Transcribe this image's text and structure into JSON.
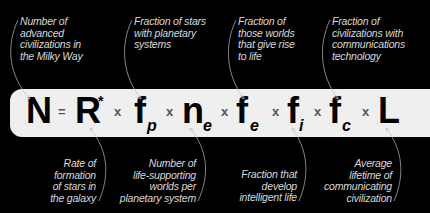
{
  "colors": {
    "background": "#000000",
    "bar": "#efefef",
    "symbol": "#000000",
    "operator": "#555555",
    "label_text": "#d8d8d8",
    "arrow": "#bbbbbb"
  },
  "equation": {
    "lhs": "N",
    "equals": "=",
    "operator": "x",
    "terms": [
      {
        "symbol": "R",
        "superscript": "*",
        "subscript": ""
      },
      {
        "symbol": "f",
        "superscript": "",
        "subscript": "p"
      },
      {
        "symbol": "n",
        "superscript": "",
        "subscript": "e"
      },
      {
        "symbol": "f",
        "superscript": "",
        "subscript": "e"
      },
      {
        "symbol": "f",
        "superscript": "",
        "subscript": "i"
      },
      {
        "symbol": "f",
        "superscript": "",
        "subscript": "c"
      },
      {
        "symbol": "L",
        "superscript": "",
        "subscript": ""
      }
    ]
  },
  "labels": {
    "top": [
      {
        "target": "N",
        "text": "Number of\nadvanced\ncivilizations in\nthe Milky Way"
      },
      {
        "target": "f_p",
        "text": "Fraction of stars\nwith planetary\nsystems"
      },
      {
        "target": "f_e",
        "text": "Fraction of\nthose worlds\nthat give rise\nto life"
      },
      {
        "target": "f_c",
        "text": "Fraction of\ncivilizations with\ncommunications\ntechnology"
      }
    ],
    "bottom": [
      {
        "target": "R*",
        "text": "Rate  of\nformation\nof stars in\nthe galaxy"
      },
      {
        "target": "n_e",
        "text": "Number of\nlife-supporting\nworlds per\nplanetary system"
      },
      {
        "target": "f_i",
        "text": "Fraction that\ndevelop\nintelligent life"
      },
      {
        "target": "L",
        "text": "Average\nlifetime of\ncommunicating\ncivilization"
      }
    ]
  }
}
